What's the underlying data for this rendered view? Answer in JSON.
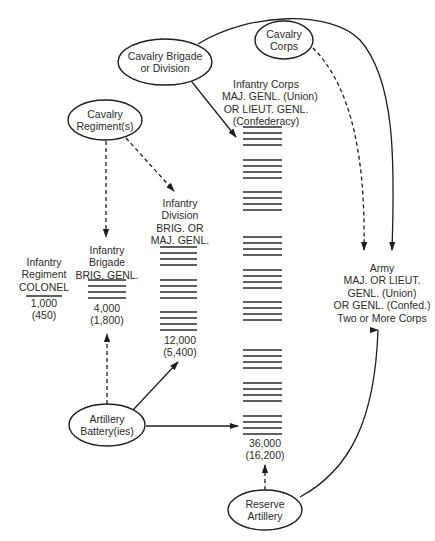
{
  "nodes": {
    "cavalry_brigade": {
      "lines": [
        "Cavalry Brigade",
        "or Division"
      ]
    },
    "cavalry_corps": {
      "lines": [
        "Cavalry",
        "Corps"
      ]
    },
    "cavalry_regiment": {
      "lines": [
        "Cavalry",
        "Regiment(s)"
      ]
    },
    "artillery_battery": {
      "lines": [
        "Artillery",
        "Battery(ies)"
      ]
    },
    "reserve_artillery": {
      "lines": [
        "Reserve",
        "Artillery"
      ]
    }
  },
  "units": {
    "regiment": {
      "title": [
        "Infantry",
        "Regiment",
        "COLONEL"
      ],
      "strength": "1,000",
      "effective": "(450)",
      "bar_groups": 1,
      "bars_per_group": 1
    },
    "brigade": {
      "title": [
        "Infantry",
        "Brigade",
        "BRIG. GENL."
      ],
      "strength": "4,000",
      "effective": "(1,800)",
      "bar_groups": 1,
      "bars_per_group": 4
    },
    "division": {
      "title": [
        "Infantry",
        "Division",
        "BRIG. OR",
        "MAJ. GENL."
      ],
      "strength": "12,000",
      "effective": "(5,400)",
      "bar_groups": 3,
      "bars_per_group": 4
    },
    "corps": {
      "title": [
        "Infantry Corps",
        "MAJ. GENL. (Union)",
        "OR  LIEUT. GENL.",
        "(Confederacy)"
      ],
      "strength": "36,000",
      "effective": "(16,200)",
      "bar_groups": 9,
      "bars_per_group": 4
    },
    "army": {
      "title": [
        "Army",
        "MAJ. OR LIEUT.",
        "GENL. (Union)",
        "OR GENL. (Confed.)",
        "Two or More Corps"
      ]
    }
  },
  "edges": [
    {
      "from": "cavalry_regiment",
      "to": "brigade",
      "style": "dashed"
    },
    {
      "from": "cavalry_regiment",
      "to": "division",
      "style": "dashed"
    },
    {
      "from": "cavalry_brigade",
      "to": "corps",
      "style": "solid"
    },
    {
      "from": "cavalry_brigade",
      "to": "army",
      "style": "solid"
    },
    {
      "from": "cavalry_corps",
      "to": "army",
      "style": "dashed"
    },
    {
      "from": "artillery_battery",
      "to": "brigade",
      "style": "dashed"
    },
    {
      "from": "artillery_battery",
      "to": "division",
      "style": "solid"
    },
    {
      "from": "artillery_battery",
      "to": "corps",
      "style": "solid"
    },
    {
      "from": "reserve_artillery",
      "to": "corps",
      "style": "dashed"
    },
    {
      "from": "reserve_artillery",
      "to": "army",
      "style": "solid"
    }
  ],
  "colors": {
    "line": "#1e1e1e",
    "text": "#2b2b2b",
    "background": "#ffffff"
  }
}
